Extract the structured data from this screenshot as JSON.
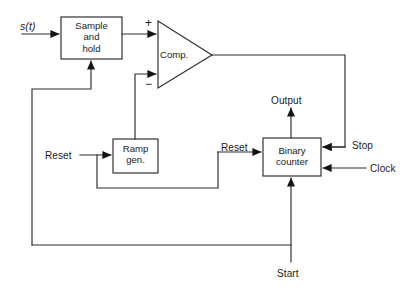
{
  "diagram": {
    "stroke_color": "#2b2b2b",
    "background_color": "#ffffff",
    "blocks": [
      {
        "id": "sample_hold",
        "label": "Sample\nand\nhold",
        "x": 61,
        "y": 17,
        "w": 61,
        "h": 42
      },
      {
        "id": "comparator",
        "label": "Comp.",
        "shape": "triangle",
        "x": 158,
        "y": 21,
        "w": 54,
        "h": 67
      },
      {
        "id": "ramp_gen",
        "label": "Ramp\ngen.",
        "x": 113,
        "y": 139,
        "w": 45,
        "h": 34
      },
      {
        "id": "binary_counter",
        "label": "Binary\ncounter",
        "x": 263,
        "y": 138,
        "w": 58,
        "h": 38
      }
    ],
    "signals": [
      {
        "id": "input_signal",
        "label": "s(t)",
        "italic": true,
        "x": 20,
        "y": 21
      },
      {
        "id": "plus_input",
        "label": "+",
        "x": 145,
        "y": 20
      },
      {
        "id": "minus_input",
        "label": "−",
        "x": 145,
        "y": 79
      },
      {
        "id": "reset_ramp",
        "label": "Reset",
        "x": 45,
        "y": 150
      },
      {
        "id": "reset_counter",
        "label": "Reset",
        "x": 221,
        "y": 142
      },
      {
        "id": "output",
        "label": "Output",
        "x": 271,
        "y": 95
      },
      {
        "id": "stop",
        "label": "Stop",
        "x": 352,
        "y": 140
      },
      {
        "id": "clock",
        "label": "Clock",
        "x": 370,
        "y": 163
      },
      {
        "id": "start",
        "label": "Start",
        "x": 277,
        "y": 268
      }
    ]
  }
}
